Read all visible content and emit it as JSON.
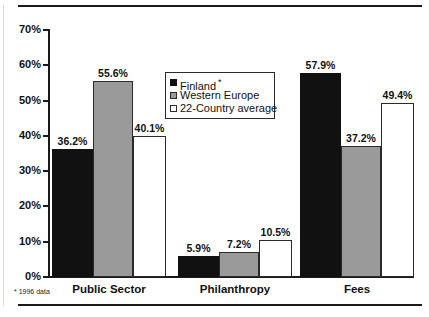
{
  "chart_data": {
    "type": "bar",
    "title": "",
    "xlabel": "",
    "ylabel": "",
    "categories": [
      "Public Sector",
      "Philanthropy",
      "Fees"
    ],
    "series": [
      {
        "name": "Finland",
        "name_suffix": "*",
        "color": "#111111",
        "values": [
          36.2,
          5.9,
          57.9
        ],
        "labels": [
          "36.2%",
          "5.9%",
          "57.9%"
        ]
      },
      {
        "name": "Western Europe",
        "name_suffix": "",
        "color": "#9a9a9a",
        "values": [
          55.6,
          7.2,
          37.2
        ],
        "labels": [
          "55.6%",
          "7.2%",
          "37.2%"
        ]
      },
      {
        "name": "22-Country average",
        "name_suffix": "",
        "color": "#ffffff",
        "values": [
          40.1,
          10.5,
          49.4
        ],
        "labels": [
          "40.1%",
          "10.5%",
          "49.4%"
        ]
      }
    ],
    "ylim": [
      0,
      70
    ],
    "ytick_values": [
      0,
      10,
      20,
      30,
      40,
      50,
      60,
      70
    ],
    "ytick_labels": [
      "0%",
      "10%",
      "20%",
      "30%",
      "40%",
      "50%",
      "60%",
      "70%"
    ],
    "grid": false,
    "legend_position": "upper-center",
    "footnote": "* 1996 data"
  }
}
